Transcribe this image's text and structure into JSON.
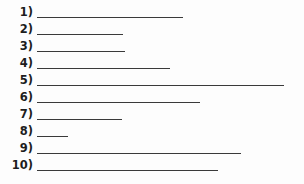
{
  "document": {
    "kind": "numbered-blank-lines-worksheet",
    "background_color": "#fdfdfd",
    "rule_color": "#3a3a3a",
    "number_color": "#1d1d1d",
    "rule_start_x": 37,
    "row_spacing": 17,
    "first_row_top": 4,
    "items": [
      {
        "number": "1)",
        "rule_start": 37,
        "rule_end": 183,
        "rule_length": 146
      },
      {
        "number": "2)",
        "rule_start": 37,
        "rule_end": 123,
        "rule_length": 86
      },
      {
        "number": "3)",
        "rule_start": 37,
        "rule_end": 125,
        "rule_length": 88
      },
      {
        "number": "4)",
        "rule_start": 37,
        "rule_end": 170,
        "rule_length": 133
      },
      {
        "number": "5)",
        "rule_start": 37,
        "rule_end": 284,
        "rule_length": 247
      },
      {
        "number": "6)",
        "rule_start": 37,
        "rule_end": 200,
        "rule_length": 163
      },
      {
        "number": "7)",
        "rule_start": 37,
        "rule_end": 122,
        "rule_length": 85
      },
      {
        "number": "8)",
        "rule_start": 37,
        "rule_end": 68,
        "rule_length": 31
      },
      {
        "number": "9)",
        "rule_start": 37,
        "rule_end": 241,
        "rule_length": 204
      },
      {
        "number": "10)",
        "rule_start": 37,
        "rule_end": 218,
        "rule_length": 181
      }
    ]
  }
}
